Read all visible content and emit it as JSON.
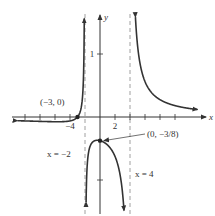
{
  "chart_data": {
    "type": "line",
    "title": "",
    "function": "y = (x + 3) / ((x + 2)(x - 4))",
    "xlabel": "x",
    "ylabel": "y",
    "xlim": [
      -12,
      14
    ],
    "ylim": [
      -1.5,
      1.6
    ],
    "x_ticks": [
      -10,
      -8,
      -6,
      -4,
      2,
      4,
      6,
      8,
      10
    ],
    "x_tick_labels": [
      {
        "value": -4,
        "label": "−4"
      },
      {
        "value": 2,
        "label": "2"
      }
    ],
    "y_ticks": [
      1,
      -1
    ],
    "y_tick_labels": [
      {
        "value": 1,
        "label": "1"
      }
    ],
    "asymptotes": [
      {
        "x": -2,
        "label": "x = −2"
      },
      {
        "x": 4,
        "label": "x = 4"
      }
    ],
    "points": [
      {
        "x": -3,
        "y": 0,
        "label": "(−3, 0)"
      },
      {
        "x": 0,
        "y": -0.375,
        "label": "(0, −3/8)"
      }
    ],
    "grid": false,
    "legend": "none"
  }
}
